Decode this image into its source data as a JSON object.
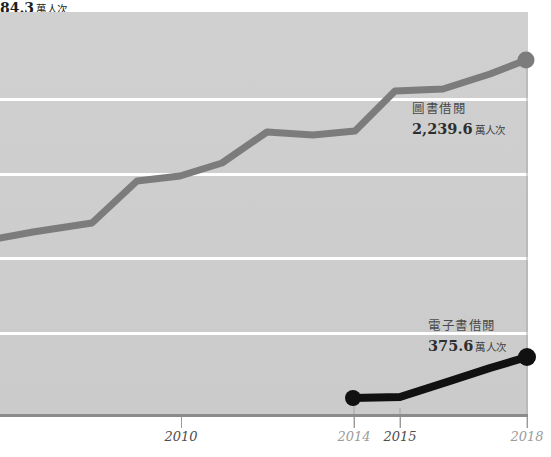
{
  "chart_data": {
    "type": "line",
    "title": "",
    "subtitle": "",
    "xlabel": "",
    "ylabel": "",
    "grid": true,
    "gridlines_y_px": [
      98,
      173,
      257,
      332
    ],
    "legend_position": "inline-annotation",
    "x_ticks": [
      {
        "label": "2010",
        "x_px": 181,
        "emphasis": "dark"
      },
      {
        "label": "2014",
        "x_px": 354,
        "emphasis": "light"
      },
      {
        "label": "2015",
        "x_px": 400,
        "emphasis": "dark"
      },
      {
        "label": "2018",
        "x_px": 527,
        "emphasis": "light"
      }
    ],
    "series": [
      {
        "name": "圖書借閱",
        "color": "#7c7c7c",
        "end_value": "2,239.6",
        "unit": "萬人次",
        "end_point": {
          "x_px": 526,
          "y_px": 60
        },
        "points_px": [
          [
            0,
            238
          ],
          [
            33,
            232
          ],
          [
            92,
            223
          ],
          [
            137,
            181
          ],
          [
            180,
            176
          ],
          [
            222,
            163
          ],
          [
            267,
            132
          ],
          [
            313,
            135
          ],
          [
            355,
            131
          ],
          [
            395,
            91
          ],
          [
            443,
            89
          ],
          [
            490,
            74
          ],
          [
            526,
            60
          ]
        ]
      },
      {
        "name": "電子書借閱",
        "color": "#111111",
        "end_value": "375.6",
        "unit": "萬人次",
        "end_point": {
          "x_px": 527,
          "y_px": 357
        },
        "points_px": [
          [
            353,
            398
          ],
          [
            400,
            397
          ],
          [
            450,
            381
          ],
          [
            490,
            368
          ],
          [
            527,
            357
          ]
        ]
      }
    ],
    "annotations": [
      {
        "id": "book-label",
        "series_name": "圖書借閱",
        "value": "2,239.6",
        "unit": "萬人次"
      },
      {
        "id": "ebook-label",
        "series_name": "電子書借閱",
        "value": "375.6",
        "unit": "萬人次"
      },
      {
        "id": "point-2014-label",
        "value": "84.3",
        "unit": "萬人次",
        "marker_point": {
          "x_px": 353,
          "y_px": 398
        }
      }
    ]
  },
  "chart": {
    "book": {
      "series_name": "圖書借閱",
      "value": "2,239.6",
      "unit": "萬人次"
    },
    "ebook": {
      "series_name": "電子書借閱",
      "value": "375.6",
      "unit": "萬人次"
    },
    "point_2014": {
      "value": "84.3",
      "unit": "萬人次"
    },
    "axis": {
      "tick_2010": "2010",
      "tick_2014": "2014",
      "tick_2015": "2015",
      "tick_2018": "2018"
    }
  },
  "colors": {
    "plot_background": "#cdcdcd",
    "gridline": "#ffffff",
    "axis_line": "#8b8b8b",
    "series_book": "#7c7c7c",
    "series_ebook": "#111111",
    "tick_label_dark": "#4e4e4e",
    "tick_label_light": "#9c9c9c"
  }
}
